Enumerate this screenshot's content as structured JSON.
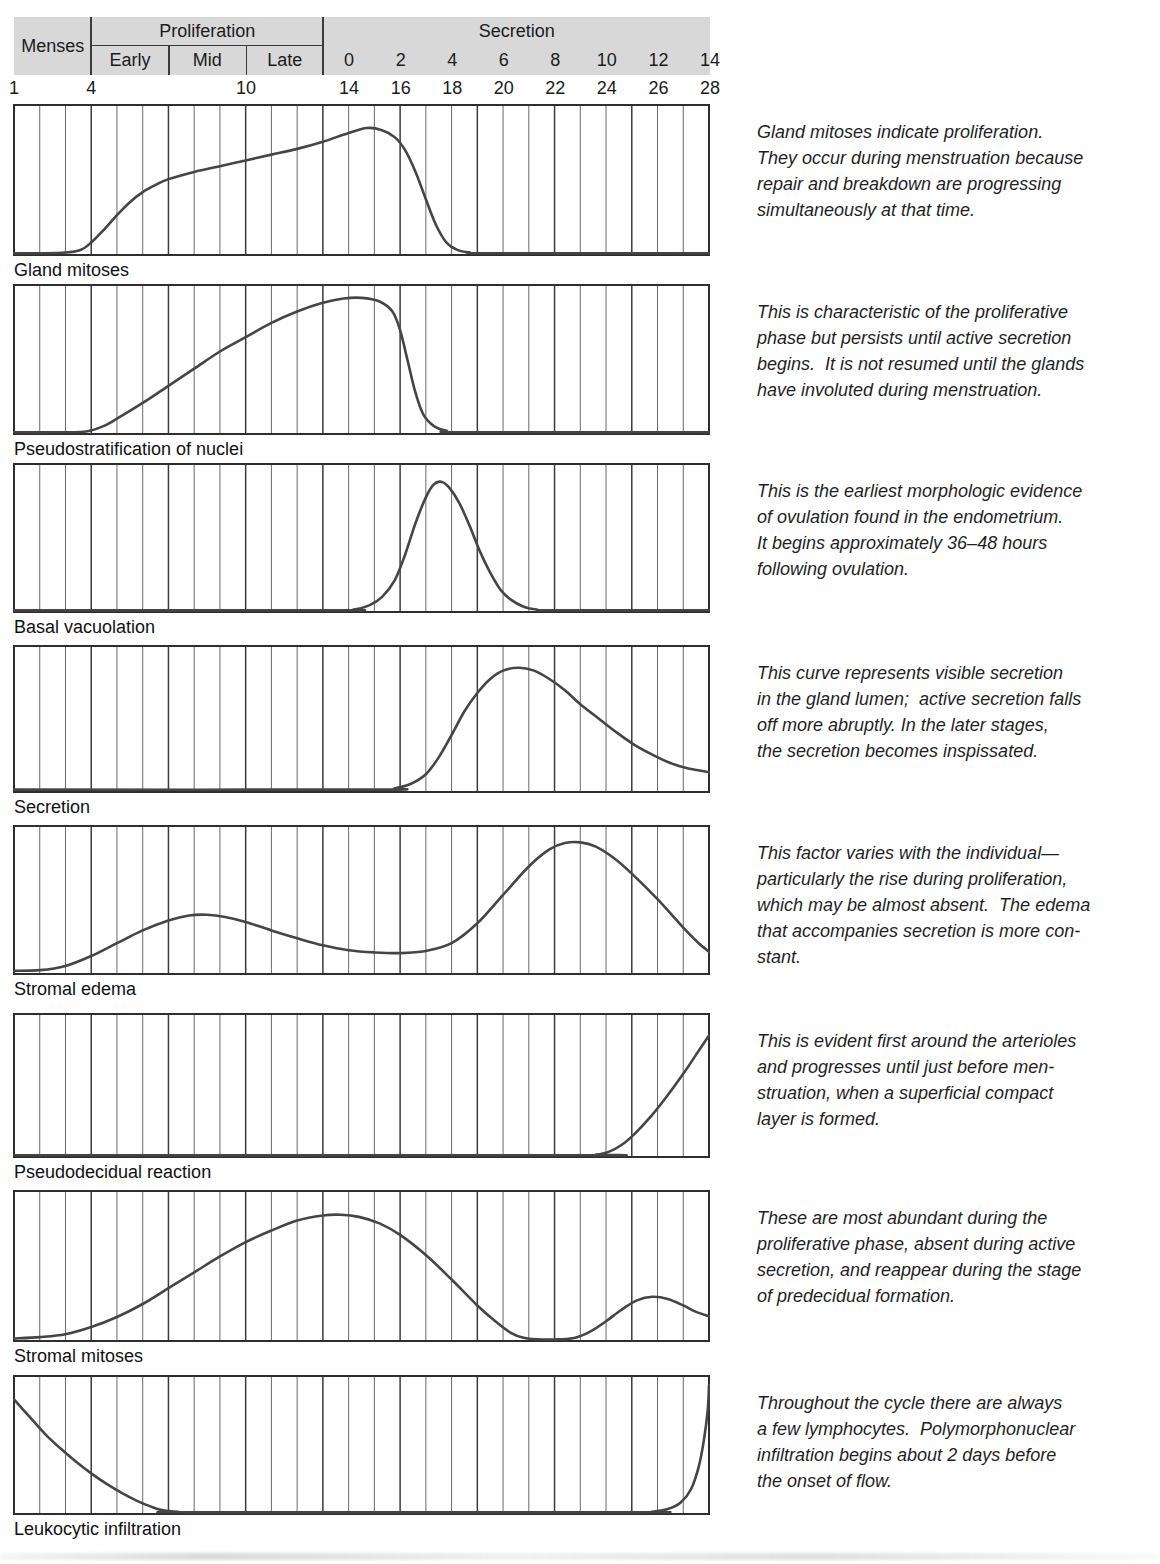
{
  "colors": {
    "band_gray": "#d8d8d8",
    "grid_minor": "#6a6a6a",
    "grid_major": "#3a3a3a",
    "frame": "#2e2e2e",
    "curve": "#454545",
    "text": "#1b1b1b"
  },
  "header": {
    "phases": [
      {
        "label": "Menses",
        "from_day": 1,
        "to_day": 4
      },
      {
        "label": "Proliferation",
        "from_day": 4,
        "to_day": 13,
        "sub": [
          {
            "label": "Early",
            "from_day": 4,
            "to_day": 7
          },
          {
            "label": "Mid",
            "from_day": 7,
            "to_day": 10
          },
          {
            "label": "Late",
            "from_day": 10,
            "to_day": 13
          }
        ]
      },
      {
        "label": "Secretion",
        "from_day": 13,
        "to_day": 28
      }
    ],
    "secretion_day_labels": [
      {
        "label": "0",
        "day": 14
      },
      {
        "label": "2",
        "day": 16
      },
      {
        "label": "4",
        "day": 18
      },
      {
        "label": "6",
        "day": 20
      },
      {
        "label": "8",
        "day": 22
      },
      {
        "label": "10",
        "day": 24
      },
      {
        "label": "12",
        "day": 26
      },
      {
        "label": "14",
        "day": 28
      }
    ],
    "cycle_day_labels": [
      {
        "label": "1",
        "day": 1
      },
      {
        "label": "4",
        "day": 4
      },
      {
        "label": "10",
        "day": 10
      },
      {
        "label": "14",
        "day": 14
      },
      {
        "label": "16",
        "day": 16
      },
      {
        "label": "18",
        "day": 18
      },
      {
        "label": "20",
        "day": 20
      },
      {
        "label": "22",
        "day": 22
      },
      {
        "label": "24",
        "day": 24
      },
      {
        "label": "26",
        "day": 26
      },
      {
        "label": "28",
        "day": 28
      }
    ]
  },
  "chart_data": [
    {
      "type": "line",
      "title": "Gland mitoses",
      "x_unit": "cycle day",
      "x_range": [
        1,
        28
      ],
      "y_range": [
        0,
        1
      ],
      "grid_minor_step_days": 1,
      "grid_major_days": [
        4,
        7,
        10,
        13,
        16,
        19,
        22,
        25
      ],
      "points": [
        [
          1,
          0.005
        ],
        [
          2,
          0.005
        ],
        [
          3,
          0.01
        ],
        [
          3.6,
          0.03
        ],
        [
          4,
          0.08
        ],
        [
          4.5,
          0.17
        ],
        [
          5,
          0.27
        ],
        [
          5.5,
          0.36
        ],
        [
          6,
          0.43
        ],
        [
          6.5,
          0.48
        ],
        [
          7,
          0.52
        ],
        [
          8,
          0.57
        ],
        [
          9,
          0.61
        ],
        [
          10,
          0.65
        ],
        [
          11,
          0.69
        ],
        [
          12,
          0.73
        ],
        [
          13,
          0.78
        ],
        [
          14,
          0.84
        ],
        [
          14.7,
          0.875
        ],
        [
          15.3,
          0.86
        ],
        [
          15.8,
          0.81
        ],
        [
          16.2,
          0.72
        ],
        [
          16.6,
          0.57
        ],
        [
          17,
          0.38
        ],
        [
          17.4,
          0.2
        ],
        [
          17.8,
          0.08
        ],
        [
          18.2,
          0.03
        ],
        [
          18.7,
          0.01
        ],
        [
          19.5,
          0.005
        ],
        [
          28,
          0.005
        ]
      ],
      "description_lines": [
        "Gland mitoses indicate proliferation.",
        "They occur during menstruation because",
        "repair and breakdown are progressing",
        "simultaneously at that time."
      ]
    },
    {
      "type": "line",
      "title": "Pseudostratification of nuclei",
      "x_unit": "cycle day",
      "x_range": [
        1,
        28
      ],
      "y_range": [
        0,
        1
      ],
      "grid_minor_step_days": 1,
      "grid_major_days": [
        4,
        7,
        10,
        13,
        16,
        19,
        22,
        25
      ],
      "points": [
        [
          1,
          0.005
        ],
        [
          3,
          0.005
        ],
        [
          3.8,
          0.01
        ],
        [
          4.5,
          0.05
        ],
        [
          5,
          0.1
        ],
        [
          6,
          0.21
        ],
        [
          7,
          0.33
        ],
        [
          8,
          0.45
        ],
        [
          9,
          0.57
        ],
        [
          10,
          0.67
        ],
        [
          11,
          0.77
        ],
        [
          12,
          0.85
        ],
        [
          13,
          0.91
        ],
        [
          13.8,
          0.94
        ],
        [
          14.5,
          0.945
        ],
        [
          15.2,
          0.92
        ],
        [
          15.7,
          0.85
        ],
        [
          16,
          0.72
        ],
        [
          16.3,
          0.5
        ],
        [
          16.6,
          0.28
        ],
        [
          16.9,
          0.13
        ],
        [
          17.3,
          0.05
        ],
        [
          17.8,
          0.015
        ],
        [
          18.5,
          0.005
        ],
        [
          28,
          0.005
        ]
      ],
      "description_lines": [
        "This is characteristic of the proliferative",
        "phase but persists until active secretion",
        "begins.  It is not resumed until the glands",
        "have involuted during menstruation."
      ]
    },
    {
      "type": "line",
      "title": "Basal vacuolation",
      "x_unit": "cycle day",
      "x_range": [
        1,
        28
      ],
      "y_range": [
        0,
        1
      ],
      "grid_minor_step_days": 1,
      "grid_major_days": [
        4,
        7,
        10,
        13,
        16,
        19,
        22,
        25
      ],
      "points": [
        [
          1,
          0.005
        ],
        [
          13.5,
          0.005
        ],
        [
          14.2,
          0.01
        ],
        [
          14.8,
          0.04
        ],
        [
          15.3,
          0.1
        ],
        [
          15.8,
          0.22
        ],
        [
          16.2,
          0.4
        ],
        [
          16.6,
          0.62
        ],
        [
          17,
          0.8
        ],
        [
          17.3,
          0.89
        ],
        [
          17.6,
          0.91
        ],
        [
          17.9,
          0.87
        ],
        [
          18.3,
          0.76
        ],
        [
          18.7,
          0.6
        ],
        [
          19.1,
          0.42
        ],
        [
          19.5,
          0.27
        ],
        [
          19.9,
          0.15
        ],
        [
          20.3,
          0.08
        ],
        [
          20.8,
          0.03
        ],
        [
          21.3,
          0.01
        ],
        [
          22,
          0.005
        ],
        [
          28,
          0.005
        ]
      ],
      "description_lines": [
        "This is the earliest morphologic evidence",
        "of ovulation found in the endometrium.",
        "It begins approximately 36–48 hours",
        "following ovulation."
      ]
    },
    {
      "type": "line",
      "title": "Secretion",
      "x_unit": "cycle day",
      "x_range": [
        1,
        28
      ],
      "y_range": [
        0,
        1
      ],
      "grid_minor_step_days": 1,
      "grid_major_days": [
        4,
        7,
        10,
        13,
        16,
        19,
        22,
        25
      ],
      "points": [
        [
          1,
          0.01
        ],
        [
          15,
          0.01
        ],
        [
          15.8,
          0.02
        ],
        [
          16.4,
          0.05
        ],
        [
          17,
          0.12
        ],
        [
          17.5,
          0.24
        ],
        [
          18,
          0.4
        ],
        [
          18.5,
          0.57
        ],
        [
          19,
          0.7
        ],
        [
          19.5,
          0.8
        ],
        [
          20,
          0.86
        ],
        [
          20.6,
          0.88
        ],
        [
          21.2,
          0.86
        ],
        [
          21.8,
          0.8
        ],
        [
          22.4,
          0.72
        ],
        [
          23,
          0.62
        ],
        [
          23.7,
          0.52
        ],
        [
          24.4,
          0.42
        ],
        [
          25.1,
          0.33
        ],
        [
          25.8,
          0.26
        ],
        [
          26.5,
          0.2
        ],
        [
          27.2,
          0.16
        ],
        [
          28,
          0.135
        ]
      ],
      "description_lines": [
        "This curve represents visible secretion",
        "in the gland lumen;  active secretion falls",
        "off more abruptly. In the later stages,",
        "the secretion becomes inspissated."
      ]
    },
    {
      "type": "line",
      "title": "Stromal edema",
      "x_unit": "cycle day",
      "x_range": [
        1,
        28
      ],
      "y_range": [
        0,
        1
      ],
      "grid_minor_step_days": 1,
      "grid_major_days": [
        4,
        7,
        10,
        13,
        16,
        19,
        22,
        25
      ],
      "points": [
        [
          1,
          0.015
        ],
        [
          2,
          0.02
        ],
        [
          3,
          0.05
        ],
        [
          4,
          0.12
        ],
        [
          5,
          0.21
        ],
        [
          6,
          0.3
        ],
        [
          7,
          0.37
        ],
        [
          7.8,
          0.405
        ],
        [
          8.5,
          0.41
        ],
        [
          9.2,
          0.395
        ],
        [
          10,
          0.36
        ],
        [
          11,
          0.3
        ],
        [
          12,
          0.245
        ],
        [
          13,
          0.195
        ],
        [
          14,
          0.16
        ],
        [
          15,
          0.145
        ],
        [
          16,
          0.14
        ],
        [
          17,
          0.155
        ],
        [
          18,
          0.21
        ],
        [
          19,
          0.35
        ],
        [
          20,
          0.55
        ],
        [
          21,
          0.75
        ],
        [
          21.8,
          0.87
        ],
        [
          22.4,
          0.915
        ],
        [
          23,
          0.92
        ],
        [
          23.6,
          0.89
        ],
        [
          24.3,
          0.81
        ],
        [
          25,
          0.7
        ],
        [
          26,
          0.52
        ],
        [
          27,
          0.32
        ],
        [
          27.6,
          0.21
        ],
        [
          28,
          0.15
        ]
      ],
      "description_lines": [
        "This factor varies with the individual—",
        "particularly the rise during proliferation,",
        "which may be almost absent.  The edema",
        "that accompanies secretion is more con-",
        "stant."
      ]
    },
    {
      "type": "line",
      "title": "Pseudodecidual reaction",
      "x_unit": "cycle day",
      "x_range": [
        1,
        28
      ],
      "y_range": [
        0,
        1
      ],
      "grid_minor_step_days": 1,
      "grid_major_days": [
        4,
        7,
        10,
        13,
        16,
        19,
        22,
        25
      ],
      "points": [
        [
          1,
          0.005
        ],
        [
          23,
          0.005
        ],
        [
          23.6,
          0.01
        ],
        [
          24.1,
          0.03
        ],
        [
          24.6,
          0.08
        ],
        [
          25.1,
          0.16
        ],
        [
          25.7,
          0.28
        ],
        [
          26.3,
          0.42
        ],
        [
          27,
          0.6
        ],
        [
          27.5,
          0.74
        ],
        [
          28,
          0.88
        ]
      ],
      "description_lines": [
        "This is evident first around the arterioles",
        "and progresses until just before men-",
        "struation, when a superficial compact",
        "layer is formed."
      ]
    },
    {
      "type": "line",
      "title": "Stromal mitoses",
      "x_unit": "cycle day",
      "x_range": [
        1,
        28
      ],
      "y_range": [
        0,
        1
      ],
      "grid_minor_step_days": 1,
      "grid_major_days": [
        4,
        7,
        10,
        13,
        16,
        19,
        22,
        25
      ],
      "points": [
        [
          1,
          0.01
        ],
        [
          2,
          0.02
        ],
        [
          3,
          0.04
        ],
        [
          4,
          0.09
        ],
        [
          5,
          0.16
        ],
        [
          6,
          0.25
        ],
        [
          7,
          0.36
        ],
        [
          8,
          0.47
        ],
        [
          9,
          0.58
        ],
        [
          10,
          0.68
        ],
        [
          11,
          0.76
        ],
        [
          12,
          0.83
        ],
        [
          13,
          0.865
        ],
        [
          13.7,
          0.87
        ],
        [
          14.4,
          0.855
        ],
        [
          15.2,
          0.81
        ],
        [
          16,
          0.73
        ],
        [
          17,
          0.59
        ],
        [
          18,
          0.42
        ],
        [
          19,
          0.24
        ],
        [
          19.7,
          0.13
        ],
        [
          20.3,
          0.05
        ],
        [
          20.8,
          0.015
        ],
        [
          21.3,
          0.005
        ],
        [
          22.2,
          0.005
        ],
        [
          22.8,
          0.015
        ],
        [
          23.4,
          0.06
        ],
        [
          24,
          0.13
        ],
        [
          24.6,
          0.21
        ],
        [
          25.2,
          0.275
        ],
        [
          25.8,
          0.3
        ],
        [
          26.4,
          0.285
        ],
        [
          27,
          0.24
        ],
        [
          27.5,
          0.195
        ],
        [
          28,
          0.165
        ]
      ],
      "description_lines": [
        "These are most abundant during the",
        "proliferative phase, absent during active",
        "secretion, and reappear during the stage",
        "of predecidual formation."
      ]
    },
    {
      "type": "line",
      "title": "Leukocytic infiltration",
      "x_unit": "cycle day",
      "x_range": [
        1,
        28
      ],
      "y_range": [
        0,
        1
      ],
      "grid_minor_step_days": 1,
      "grid_major_days": [
        4,
        7,
        10,
        13,
        16,
        19,
        22,
        25
      ],
      "points": [
        [
          1,
          0.86
        ],
        [
          1.6,
          0.73
        ],
        [
          2.2,
          0.6
        ],
        [
          2.8,
          0.49
        ],
        [
          3.4,
          0.39
        ],
        [
          4,
          0.3
        ],
        [
          4.6,
          0.22
        ],
        [
          5.2,
          0.15
        ],
        [
          5.8,
          0.09
        ],
        [
          6.3,
          0.05
        ],
        [
          6.8,
          0.02
        ],
        [
          7.4,
          0.008
        ],
        [
          8,
          0.005
        ],
        [
          25,
          0.005
        ],
        [
          25.8,
          0.01
        ],
        [
          26.4,
          0.03
        ],
        [
          26.9,
          0.08
        ],
        [
          27.3,
          0.18
        ],
        [
          27.6,
          0.35
        ],
        [
          27.8,
          0.55
        ],
        [
          27.95,
          0.78
        ],
        [
          28,
          0.97
        ]
      ],
      "description_lines": [
        "Throughout the cycle there are always",
        "a few lymphocytes.  Polymorphonuclear",
        "infiltration begins about 2 days before",
        "the onset of flow."
      ]
    }
  ]
}
